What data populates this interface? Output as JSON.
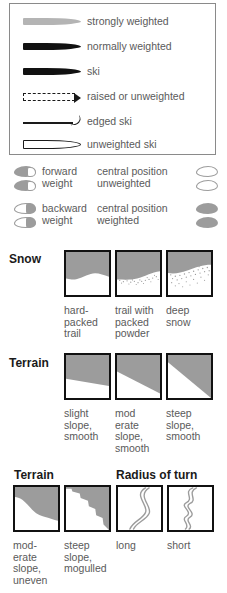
{
  "legend": {
    "items": [
      {
        "symbol": "gray-tapered-ski",
        "label": "strongly weighted"
      },
      {
        "symbol": "black-tapered-ski",
        "label": "normally weighted"
      },
      {
        "symbol": "black-tapered-ski",
        "label": "ski"
      },
      {
        "symbol": "dashed-outline-ski-arrow",
        "label": "raised or unweighted"
      },
      {
        "symbol": "thin-line-edged-ski",
        "label": "edged ski"
      },
      {
        "symbol": "hollow-outline-ski",
        "label": "unweighted ski"
      }
    ]
  },
  "weight": {
    "rows": [
      {
        "left_icon": "forward-weight-sole-icon",
        "left_label_line1": "forward",
        "left_label_line2": "weight",
        "center_label_line1": "central position",
        "center_label_line2": "unweighted",
        "right_icon": "unweighted-sole-icon"
      },
      {
        "left_icon": "backward-weight-sole-icon",
        "left_label_line1": "backward",
        "left_label_line2": "weight",
        "center_label_line1": "central position",
        "center_label_line2": "weighted",
        "right_icon": "weighted-sole-icon"
      }
    ]
  },
  "snow": {
    "title": "Snow",
    "tiles": [
      {
        "icon": "hard-packed-trail-tile",
        "caption": "hard-\npacked\ntrail"
      },
      {
        "icon": "packed-powder-tile",
        "caption": "trail with\npacked\npowder"
      },
      {
        "icon": "deep-snow-tile",
        "caption": "deep\nsnow"
      }
    ]
  },
  "terrain_smooth": {
    "title": "Terrain",
    "tiles": [
      {
        "icon": "slight-slope-tile",
        "caption": "slight\nslope,\nsmooth"
      },
      {
        "icon": "moderate-slope-tile",
        "caption": "mod\nerate\nslope,\nsmooth"
      },
      {
        "icon": "steep-slope-tile",
        "caption": "steep\nslope,\nsmooth"
      }
    ]
  },
  "terrain_uneven": {
    "title": "Terrain",
    "tiles": [
      {
        "icon": "moderate-uneven-tile",
        "caption": "mod-\nerate\nslope,\nuneven"
      },
      {
        "icon": "steep-mogulled-tile",
        "caption": "steep\nslope,\nmogulled"
      }
    ]
  },
  "radius": {
    "title": "Radius of turn",
    "tiles": [
      {
        "icon": "long-radius-track-tile",
        "caption": "long"
      },
      {
        "icon": "short-radius-track-tile",
        "caption": "short"
      }
    ]
  },
  "colors": {
    "gray_fill": "#9c9c9c",
    "light_gray": "#b4b4b4",
    "ink": "#111111",
    "text": "#5a5a5a",
    "border": "#8a8a8a"
  }
}
